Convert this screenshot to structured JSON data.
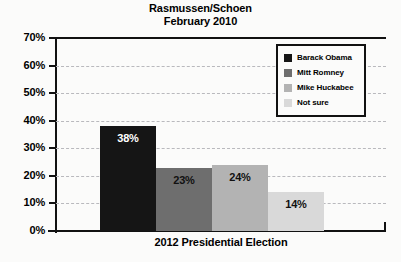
{
  "chart_data": {
    "type": "bar",
    "title": "Rasmussen/Schoen",
    "subtitle": "February 2010",
    "xlabel": "2012 Presidential Election",
    "ylabel": "",
    "ylim": [
      0,
      70
    ],
    "ytick_labels": [
      "0%",
      "10%",
      "20%",
      "30%",
      "40%",
      "50%",
      "60%",
      "70%"
    ],
    "ytick_values": [
      0,
      10,
      20,
      30,
      40,
      50,
      60,
      70
    ],
    "grid": true,
    "legend_position": "top-right",
    "categories": [
      "Barack Obama",
      "Mitt Romney",
      "Mike Huckabee",
      "Not sure"
    ],
    "values": [
      38,
      23,
      24,
      14
    ],
    "value_labels": [
      "38%",
      "23%",
      "24%",
      "14%"
    ],
    "colors": [
      "#151515",
      "#6e6e6e",
      "#b3b3b3",
      "#d9d9d9"
    ],
    "label_colors": [
      "#ffffff",
      "#111111",
      "#111111",
      "#111111"
    ]
  },
  "legend": {
    "items": [
      {
        "label": "Barack Obama",
        "color": "#151515"
      },
      {
        "label": "Mitt Romney",
        "color": "#6e6e6e"
      },
      {
        "label": "Mike Huckabee",
        "color": "#b3b3b3"
      },
      {
        "label": "Not sure",
        "color": "#d9d9d9"
      }
    ]
  }
}
